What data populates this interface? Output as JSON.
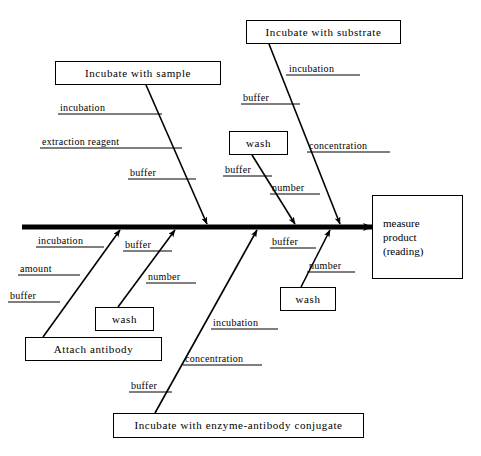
{
  "diagram": {
    "type": "fishbone-ishikawa",
    "title": "",
    "effect": {
      "lines": [
        "measure",
        "product",
        "(reading)"
      ],
      "box": {
        "x": 372,
        "y": 195,
        "w": 91,
        "h": 84
      }
    },
    "spine": {
      "x1": 22,
      "y1": 227,
      "x2": 372,
      "y2": 227
    },
    "categories": [
      {
        "id": "incubate-with-sample",
        "label": "Incubate with sample",
        "side": "top",
        "box": {
          "x": 55,
          "y": 61,
          "w": 166,
          "h": 24
        },
        "line": {
          "x1": 146,
          "y1": 85,
          "x2": 207,
          "y2": 224
        },
        "causes": [
          {
            "label": "incubation",
            "x": 60,
            "y": 103,
            "rule": {
              "x1": 58,
              "y1": 114,
              "x2": 162,
              "y2": 114
            }
          },
          {
            "label": "extraction reagent",
            "x": 42,
            "y": 137,
            "rule": {
              "x1": 40,
              "y1": 148,
              "x2": 182,
              "y2": 148
            }
          },
          {
            "label": "buffer",
            "x": 130,
            "y": 168,
            "rule": {
              "x1": 128,
              "y1": 179,
              "x2": 196,
              "y2": 179
            }
          }
        ]
      },
      {
        "id": "incubate-with-substrate",
        "label": "Incubate with substrate",
        "side": "top",
        "box": {
          "x": 246,
          "y": 20,
          "w": 155,
          "h": 24
        },
        "line": {
          "x1": 269,
          "y1": 44,
          "x2": 340,
          "y2": 224
        },
        "causes": [
          {
            "label": "incubation",
            "x": 289,
            "y": 64,
            "rule": {
              "x1": 286,
              "y1": 75,
              "x2": 360,
              "y2": 75
            }
          },
          {
            "label": "buffer",
            "x": 243,
            "y": 93,
            "rule": {
              "x1": 241,
              "y1": 104,
              "x2": 300,
              "y2": 104
            }
          },
          {
            "label": "concentration",
            "x": 309,
            "y": 141,
            "rule": {
              "x1": 307,
              "y1": 152,
              "x2": 390,
              "y2": 152
            }
          }
        ]
      },
      {
        "id": "wash-upper",
        "label": "wash",
        "side": "top",
        "box": {
          "x": 229,
          "y": 131,
          "w": 59,
          "h": 24
        },
        "line": {
          "x1": 252,
          "y1": 155,
          "x2": 295,
          "y2": 224
        },
        "causes": [
          {
            "label": "buffer",
            "x": 225,
            "y": 165,
            "rule": {
              "x1": 223,
              "y1": 176,
              "x2": 272,
              "y2": 176
            }
          },
          {
            "label": "number",
            "x": 272,
            "y": 183,
            "rule": {
              "x1": 270,
              "y1": 194,
              "x2": 320,
              "y2": 194
            }
          }
        ]
      },
      {
        "id": "attach-antibody",
        "label": "Attach antibody",
        "side": "bottom",
        "box": {
          "x": 25,
          "y": 337,
          "w": 137,
          "h": 24
        },
        "line": {
          "x1": 43,
          "y1": 337,
          "x2": 120,
          "y2": 230
        },
        "causes": [
          {
            "label": "incubation",
            "x": 38,
            "y": 236,
            "rule": {
              "x1": 36,
              "y1": 247,
              "x2": 104,
              "y2": 247
            }
          },
          {
            "label": "amount",
            "x": 20,
            "y": 264,
            "rule": {
              "x1": 18,
              "y1": 275,
              "x2": 80,
              "y2": 275
            }
          },
          {
            "label": "buffer",
            "x": 10,
            "y": 291,
            "rule": {
              "x1": 8,
              "y1": 302,
              "x2": 60,
              "y2": 302
            }
          }
        ]
      },
      {
        "id": "wash-lower",
        "label": "wash",
        "side": "bottom",
        "box": {
          "x": 95,
          "y": 307,
          "w": 59,
          "h": 24
        },
        "line": {
          "x1": 118,
          "y1": 307,
          "x2": 175,
          "y2": 230
        },
        "causes": [
          {
            "label": "buffer",
            "x": 125,
            "y": 240,
            "rule": {
              "x1": 123,
              "y1": 251,
              "x2": 172,
              "y2": 251
            }
          },
          {
            "label": "number",
            "x": 148,
            "y": 272,
            "rule": {
              "x1": 146,
              "y1": 283,
              "x2": 196,
              "y2": 283
            }
          }
        ]
      },
      {
        "id": "incubate-with-conjugate",
        "label": "Incubate with enzyme-antibody conjugate",
        "side": "bottom",
        "box": {
          "x": 113,
          "y": 413,
          "w": 251,
          "h": 25
        },
        "line": {
          "x1": 155,
          "y1": 413,
          "x2": 257,
          "y2": 230
        },
        "causes": [
          {
            "label": "incubation",
            "x": 213,
            "y": 318,
            "rule": {
              "x1": 211,
              "y1": 329,
              "x2": 278,
              "y2": 329
            }
          },
          {
            "label": "concentration",
            "x": 185,
            "y": 354,
            "rule": {
              "x1": 183,
              "y1": 365,
              "x2": 262,
              "y2": 365
            }
          },
          {
            "label": "buffer",
            "x": 131,
            "y": 381,
            "rule": {
              "x1": 129,
              "y1": 392,
              "x2": 172,
              "y2": 392
            }
          }
        ]
      },
      {
        "id": "wash-right",
        "label": "wash",
        "side": "bottom",
        "box": {
          "x": 280,
          "y": 287,
          "w": 56,
          "h": 24
        },
        "line": {
          "x1": 301,
          "y1": 287,
          "x2": 330,
          "y2": 230
        },
        "causes": [
          {
            "label": "buffer",
            "x": 272,
            "y": 237,
            "rule": {
              "x1": 270,
              "y1": 248,
              "x2": 316,
              "y2": 248
            }
          },
          {
            "label": "number",
            "x": 309,
            "y": 261,
            "rule": {
              "x1": 307,
              "y1": 272,
              "x2": 355,
              "y2": 272
            }
          }
        ]
      }
    ],
    "colors": {
      "stroke": "#000000",
      "background": "#ffffff",
      "text": "#000000"
    }
  }
}
